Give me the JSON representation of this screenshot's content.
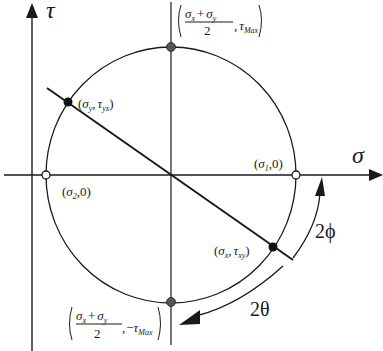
{
  "diagram": {
    "colors": {
      "stroke": "#1a1a1a",
      "filled_point": "#111111",
      "max_point": "#555555",
      "open_point": "#ffffff"
    },
    "axes": {
      "horizontal": {
        "label": "σ"
      },
      "vertical": {
        "label": "τ"
      }
    },
    "points": [
      {
        "id": "sigma_y_tau_yx",
        "label_main": "(σ",
        "label_parts": [
          "σ",
          "y",
          "τ",
          "yx"
        ],
        "style": "filled"
      },
      {
        "id": "sigma_x_tau_xy",
        "label_parts": [
          "σ",
          "x",
          "τ",
          "xy"
        ],
        "style": "filled"
      },
      {
        "id": "sigma_1",
        "label_parts": [
          "σ",
          "1",
          "0"
        ],
        "style": "open"
      },
      {
        "id": "sigma_2",
        "label_parts": [
          "σ",
          "2",
          "0"
        ],
        "style": "open"
      },
      {
        "id": "tau_max",
        "label_parts": [
          "σ",
          "x",
          "σ",
          "y",
          "2",
          "τ",
          "Max"
        ],
        "style": "gray"
      },
      {
        "id": "neg_tau_max",
        "label_parts": [
          "σ",
          "x",
          "σ",
          "y",
          "2",
          "−τ",
          "Max"
        ],
        "style": "gray"
      }
    ],
    "angles": [
      {
        "id": "two_phi",
        "label": "2ϕ"
      },
      {
        "id": "two_theta",
        "label": "2θ"
      }
    ],
    "text": {
      "sigma": "σ",
      "tau": "τ",
      "sub_x": "x",
      "sub_y": "y",
      "sub_1": "1",
      "sub_2": "2",
      "sub_yx": "yx",
      "sub_xy": "xy",
      "sub_max": "Max",
      "zero": "0",
      "two": "2",
      "plus": "+",
      "comma": ",",
      "minus": "−",
      "lparen": "(",
      "rparen": ")",
      "two_phi": "2ϕ",
      "two_theta": "2θ"
    }
  }
}
